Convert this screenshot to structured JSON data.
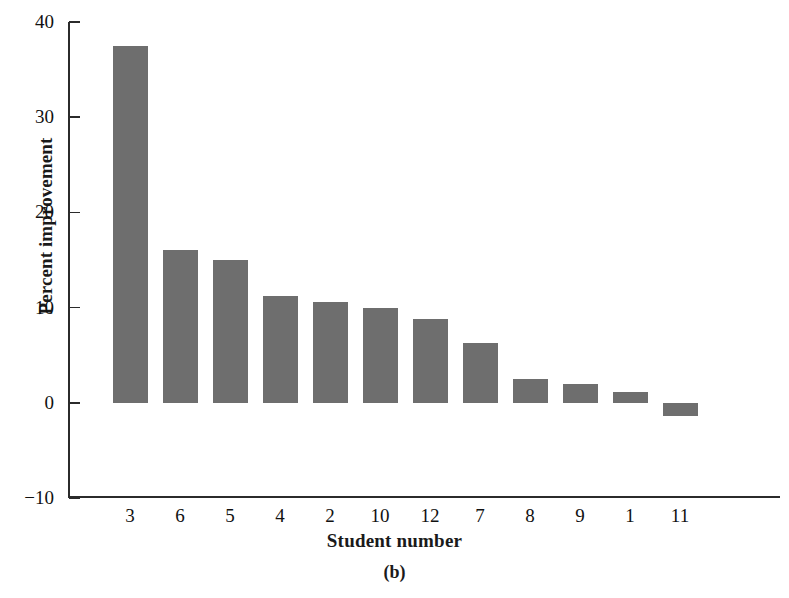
{
  "chart_data": {
    "type": "bar",
    "title": "",
    "caption": "(b)",
    "xlabel": "Student number",
    "ylabel": "Percent improvement",
    "categories": [
      "3",
      "6",
      "5",
      "4",
      "2",
      "10",
      "12",
      "7",
      "8",
      "9",
      "1",
      "11"
    ],
    "values": [
      37.5,
      16.0,
      15.0,
      11.2,
      10.6,
      10.0,
      8.8,
      6.3,
      2.5,
      2.0,
      1.1,
      -1.4
    ],
    "ylim": [
      -10,
      40
    ],
    "yticks": [
      40,
      30,
      20,
      10,
      0,
      -10
    ],
    "ytick_labels": [
      "40",
      "30",
      "20",
      "10",
      "0",
      "−10"
    ],
    "grid": false,
    "legend": false,
    "bar_color": "#6e6e6e",
    "axis_color": "#2b2b2b",
    "background": "#ffffff"
  }
}
